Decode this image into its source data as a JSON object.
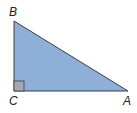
{
  "diagram": {
    "type": "right-triangle",
    "vertices": {
      "B": {
        "label": "B",
        "x": 14,
        "y": 21
      },
      "C": {
        "label": "C",
        "x": 14,
        "y": 91
      },
      "A": {
        "label": "A",
        "x": 128,
        "y": 91
      }
    },
    "right_angle_at": "C",
    "colors": {
      "fill": "#8eb0d8",
      "stroke": "#3a3f47",
      "right_angle_marker": "#a3a9ae",
      "label": "#222222"
    }
  }
}
